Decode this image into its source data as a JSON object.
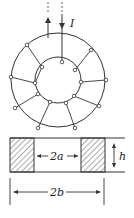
{
  "figure": {
    "type": "toroid-winding-diagram",
    "labels": {
      "current": "I",
      "inner_diameter": "2a",
      "outer_diameter": "2b",
      "height": "h"
    },
    "colors": {
      "line": "#333333",
      "hatch": "#444444",
      "background": "#ffffff"
    },
    "winding_turns": 9
  }
}
